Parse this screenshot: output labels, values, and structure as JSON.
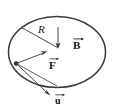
{
  "figure": {
    "type": "physics-vector-diagram",
    "background_color": "#ffffff",
    "stroke_color": "#3a3a3a",
    "text_color": "#111111",
    "labels": {
      "radius": "R",
      "field": "B",
      "force": "F",
      "velocity": "u"
    },
    "vector_arrow_glyph": "→",
    "shapes": {
      "ellipse": {
        "cx": 57,
        "cy": 52,
        "rx": 49,
        "ry": 36
      },
      "center_point": {
        "x": 58,
        "y": 48
      },
      "edge_point": {
        "x": 16,
        "y": 64
      }
    },
    "vectors": [
      {
        "name": "B",
        "label": "B",
        "direction": "down",
        "from": {
          "x": 58,
          "y": 28
        },
        "to": {
          "x": 58,
          "y": 47
        }
      },
      {
        "name": "F",
        "label": "F",
        "direction": "up-right",
        "from": {
          "x": 16,
          "y": 64
        },
        "to": {
          "x": 47,
          "y": 52
        }
      },
      {
        "name": "u",
        "label": "u",
        "direction": "down-right",
        "from": {
          "x": 16,
          "y": 64
        },
        "to": {
          "x": 50,
          "y": 95
        }
      },
      {
        "name": "R",
        "label": "R",
        "direction": "down-right",
        "from": {
          "x": 21,
          "y": 27
        },
        "to": {
          "x": 57,
          "y": 47
        }
      }
    ]
  }
}
